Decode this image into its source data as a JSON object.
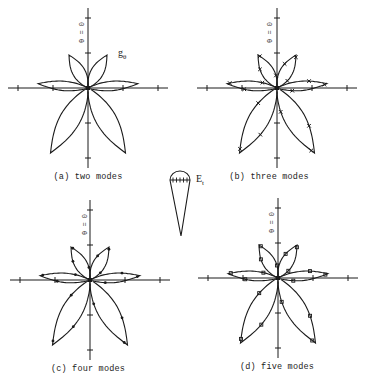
{
  "figure": {
    "panels": [
      {
        "id": "a",
        "caption": "(a) two modes",
        "axis_label": "θ = 0",
        "lobe_label": "g",
        "lobe_sub": "θ",
        "markers": false
      },
      {
        "id": "b",
        "caption": "(b) three modes",
        "axis_label": "θ = 0",
        "markers": true,
        "marker_style": "x"
      },
      {
        "id": "c",
        "caption": "(c) four modes",
        "axis_label": "θ = 0",
        "markers": true,
        "marker_style": "dot"
      },
      {
        "id": "d",
        "caption": "(d) five modes",
        "axis_label": "θ = 0",
        "markers": true,
        "marker_style": "square"
      }
    ],
    "cone": {
      "label": "E",
      "label_sub": "t"
    },
    "stroke_color": "#1a1a1a",
    "background": "#ffffff"
  }
}
